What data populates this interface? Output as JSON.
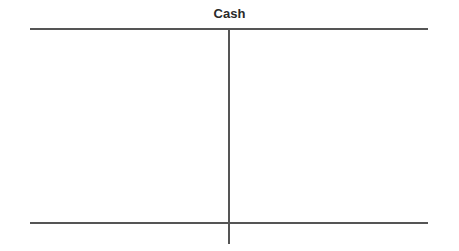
{
  "t_account": {
    "title": "Cash",
    "debit_side_entries": [],
    "credit_side_entries": []
  }
}
